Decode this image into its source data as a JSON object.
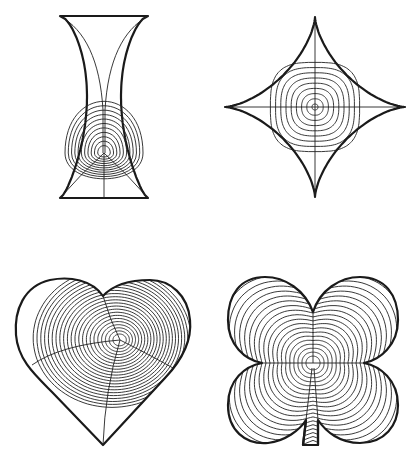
{
  "figure": {
    "panels": [
      {
        "id": "hourglass",
        "shape": "hourglass (concave-sided trapezoid)",
        "contour_count": 11
      },
      {
        "id": "astroid",
        "shape": "four-pointed star (astroid)",
        "contour_count": 9
      },
      {
        "id": "heart",
        "shape": "heart",
        "contour_count": 22
      },
      {
        "id": "clover",
        "shape": "four-leaf clover with stem",
        "contour_count": 20
      }
    ],
    "colors": {
      "stroke": "#1a1a1a",
      "background": "#ffffff"
    }
  }
}
